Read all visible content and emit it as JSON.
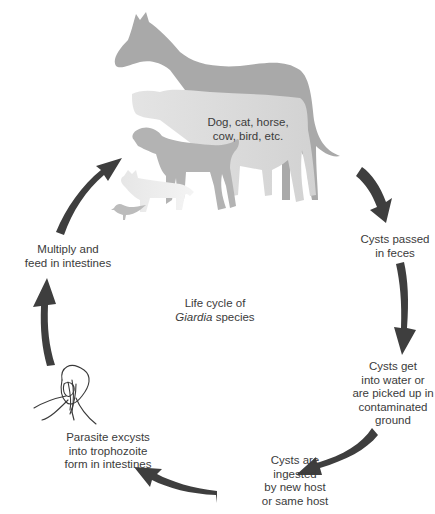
{
  "diagram": {
    "title_line1": "Life cycle of",
    "title_italic": "Giardia",
    "title_rest": " species",
    "hosts": {
      "line1": "Dog, cat, horse,",
      "line2": "cow, bird, etc.",
      "animals": [
        "horse",
        "cow",
        "dog",
        "cat",
        "bird"
      ]
    },
    "stages": [
      {
        "id": "cysts-passed",
        "lines": [
          "Cysts passed",
          "in feces"
        ]
      },
      {
        "id": "cysts-environment",
        "lines": [
          "Cysts get",
          "into water or",
          "are picked up in",
          "contaminated",
          "ground"
        ]
      },
      {
        "id": "cysts-ingested",
        "lines": [
          "Cysts are",
          "ingested",
          "by new host",
          "or same host"
        ]
      },
      {
        "id": "excystation",
        "lines": [
          "Parasite excysts",
          "into trophozoite",
          "form in intestines"
        ]
      },
      {
        "id": "multiply",
        "lines": [
          "Multiply and",
          "feed in intestines"
        ]
      }
    ],
    "colors": {
      "arrow": "#3e3e3e",
      "horse": "#a8a8a8",
      "cow": "#dedede",
      "dog": "#b4b4b4",
      "cat": "#e2e2e2",
      "bird": "#bdbdbd",
      "text": "#3b3b3b"
    }
  }
}
